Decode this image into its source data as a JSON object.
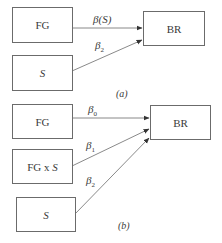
{
  "diagram_a": {
    "nodes": {
      "fg": "FG",
      "s": "S",
      "br": "BR"
    },
    "edges": [
      {
        "from": "FG",
        "to": "BR",
        "label_base": "β(S)",
        "label_sub": ""
      },
      {
        "from": "S",
        "to": "BR",
        "label_base": "β",
        "label_sub": "2"
      }
    ],
    "caption": "(a)"
  },
  "diagram_b": {
    "nodes": {
      "fg": "FG",
      "fgxs_prefix": "FG x ",
      "fgxs_var": "S",
      "s": "S",
      "br": "BR"
    },
    "edges": [
      {
        "from": "FG",
        "to": "BR",
        "label_base": "β",
        "label_sub": "0"
      },
      {
        "from": "FG x S",
        "to": "BR",
        "label_base": "β",
        "label_sub": "1"
      },
      {
        "from": "S",
        "to": "BR",
        "label_base": "β",
        "label_sub": "2"
      }
    ],
    "caption": "(b)"
  },
  "colors": {
    "line": "#6b6b6b",
    "text": "#3a3a3a"
  }
}
